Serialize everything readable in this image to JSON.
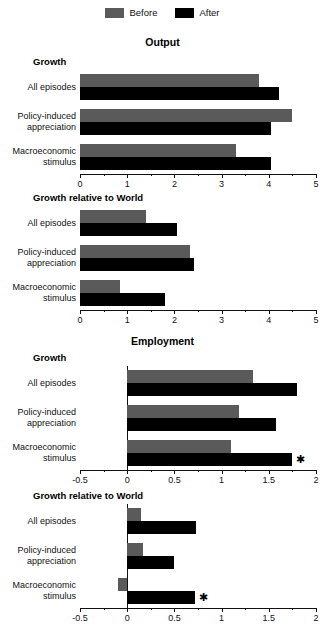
{
  "legend": {
    "entries": [
      {
        "label": "Before",
        "color": "#5a5a5a",
        "swatch": "before-swatch"
      },
      {
        "label": "After",
        "color": "#000000",
        "swatch": "after-swatch"
      }
    ]
  },
  "titles": {
    "output": "Output",
    "employment": "Employment"
  },
  "subtitles": {
    "growth": "Growth",
    "growth_rel_world": "Growth relative to World"
  },
  "categories": [
    "All episodes",
    [
      "Policy-induced",
      "appreciation"
    ],
    [
      "Macroeconomic",
      "stimulus"
    ]
  ],
  "significance_marker": "✱",
  "chart_data": [
    {
      "id": "output-growth",
      "type": "bar",
      "orientation": "horizontal",
      "title": "Output",
      "subtitle": "Growth",
      "categories": [
        "All episodes",
        "Policy-induced appreciation",
        "Macroeconomic stimulus"
      ],
      "series": [
        {
          "name": "Before",
          "color": "#5a5a5a",
          "values": [
            3.8,
            4.5,
            3.3
          ]
        },
        {
          "name": "After",
          "color": "#000000",
          "values": [
            4.22,
            4.05,
            4.05
          ]
        }
      ],
      "xlim": [
        0,
        5
      ],
      "xticks": [
        0,
        1,
        2,
        3,
        4,
        5
      ],
      "xtick_labels": [
        "0",
        "1",
        "2",
        "3",
        "4",
        "5"
      ],
      "minor_tick_step": 0.5,
      "xlabel": "",
      "ylabel": "",
      "grid": false,
      "legend_position": "top-center",
      "annotations": []
    },
    {
      "id": "output-growth-rel-world",
      "type": "bar",
      "orientation": "horizontal",
      "title": "Output",
      "subtitle": "Growth relative to World",
      "categories": [
        "All episodes",
        "Policy-induced appreciation",
        "Macroeconomic stimulus"
      ],
      "series": [
        {
          "name": "Before",
          "color": "#5a5a5a",
          "values": [
            1.4,
            2.32,
            0.85
          ]
        },
        {
          "name": "After",
          "color": "#000000",
          "values": [
            2.05,
            2.42,
            1.8
          ]
        }
      ],
      "xlim": [
        0,
        5
      ],
      "xticks": [
        0,
        1,
        2,
        3,
        4,
        5
      ],
      "xtick_labels": [
        "0",
        "1",
        "2",
        "3",
        "4",
        "5"
      ],
      "minor_tick_step": 0.5,
      "xlabel": "",
      "ylabel": "",
      "grid": false,
      "legend_position": "top-center",
      "annotations": []
    },
    {
      "id": "employment-growth",
      "type": "bar",
      "orientation": "horizontal",
      "title": "Employment",
      "subtitle": "Growth",
      "categories": [
        "All episodes",
        "Policy-induced appreciation",
        "Macroeconomic stimulus"
      ],
      "series": [
        {
          "name": "Before",
          "color": "#5a5a5a",
          "values": [
            1.33,
            1.18,
            1.1
          ]
        },
        {
          "name": "After",
          "color": "#000000",
          "values": [
            1.8,
            1.58,
            1.75
          ]
        }
      ],
      "xlim": [
        -0.5,
        2
      ],
      "xticks": [
        -0.5,
        0,
        0.5,
        1,
        1.5,
        2
      ],
      "xtick_labels": [
        "-0.5",
        "0",
        "0.5",
        "1",
        "1.5",
        "2"
      ],
      "minor_tick_step": 0.25,
      "xlabel": "",
      "ylabel": "",
      "grid": false,
      "legend_position": "top-center",
      "annotations": [
        {
          "series": "After",
          "category": "Macroeconomic stimulus",
          "marker": "✱"
        }
      ]
    },
    {
      "id": "employment-growth-rel-world",
      "type": "bar",
      "orientation": "horizontal",
      "title": "Employment",
      "subtitle": "Growth relative to World",
      "categories": [
        "All episodes",
        "Policy-induced appreciation",
        "Macroeconomic stimulus"
      ],
      "series": [
        {
          "name": "Before",
          "color": "#5a5a5a",
          "values": [
            0.15,
            0.17,
            -0.1
          ]
        },
        {
          "name": "After",
          "color": "#000000",
          "values": [
            0.73,
            0.5,
            0.72
          ]
        }
      ],
      "xlim": [
        -0.5,
        2
      ],
      "xticks": [
        -0.5,
        0,
        0.5,
        1,
        1.5,
        2
      ],
      "xtick_labels": [
        "-0.5",
        "0",
        "0.5",
        "1",
        "1.5",
        "2"
      ],
      "minor_tick_step": 0.25,
      "xlabel": "",
      "ylabel": "",
      "grid": false,
      "legend_position": "top-center",
      "annotations": [
        {
          "series": "After",
          "category": "Macroeconomic stimulus",
          "marker": "✱"
        }
      ]
    }
  ]
}
